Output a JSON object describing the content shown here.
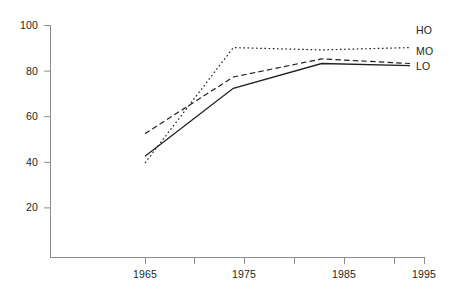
{
  "chart_data": {
    "type": "line",
    "title": "",
    "subtitle": "",
    "xlabel": "",
    "ylabel": "",
    "x": [
      1965,
      1975,
      1985,
      1995
    ],
    "categories": [
      "1965",
      "1975",
      "1985",
      "1995"
    ],
    "series": [
      {
        "name": "HO",
        "style": "dotted",
        "color": "#231f20",
        "values": [
          42,
          93,
          92,
          93
        ]
      },
      {
        "name": "MO",
        "style": "dashed",
        "color": "#231f20",
        "values": [
          55,
          80,
          88,
          86
        ]
      },
      {
        "name": "LO",
        "style": "solid",
        "color": "#231f20",
        "values": [
          45,
          75,
          86,
          85
        ]
      }
    ],
    "xlim": [
      1960,
      1998
    ],
    "ylim": [
      0,
      103
    ],
    "x_ticks_major": [
      1965,
      1975,
      1985,
      1995
    ],
    "x_ticks_minor": [
      1970,
      1980,
      1990
    ],
    "y_ticks": [
      20,
      40,
      60,
      80,
      100
    ],
    "grid": false,
    "legend_position": "right-end-of-line"
  },
  "axes": {
    "y_tick_labels": [
      "100",
      "80",
      "60",
      "40",
      "20"
    ],
    "x_tick_labels": [
      "1965",
      "1975",
      "1985",
      "1995"
    ]
  },
  "legend": {
    "entries": [
      {
        "label": "HO"
      },
      {
        "label": "MO"
      },
      {
        "label": "LO"
      }
    ]
  }
}
